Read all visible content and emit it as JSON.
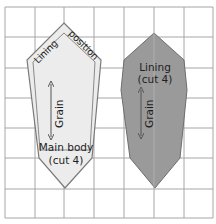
{
  "diagram": {
    "type": "sewing-pattern",
    "grid": {
      "x_lines": [
        5,
        35,
        64,
        94,
        124,
        154,
        184,
        213
      ],
      "y_lines": [
        7,
        37,
        68,
        98,
        128,
        158,
        189,
        218
      ],
      "color": "#a6a6a6"
    },
    "pieces": [
      {
        "id": "main-body",
        "label_line1": "Main body",
        "label_line2": "(cut 4)",
        "fill": "#ececec",
        "stroke": "#7a7a7a",
        "grain_label": "Grain",
        "inner_outline_label": "Lining position"
      },
      {
        "id": "lining",
        "label_line1": "Lining",
        "label_line2": "(cut 4)",
        "fill": "#9a9a9a",
        "stroke": "#6e6e6e",
        "grain_label": "Grain"
      }
    ]
  }
}
